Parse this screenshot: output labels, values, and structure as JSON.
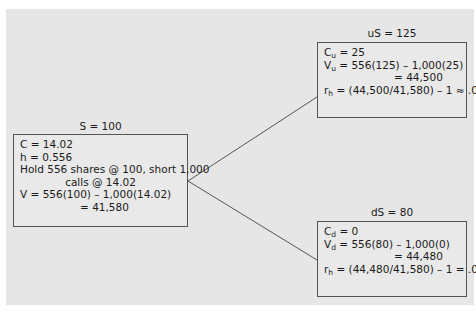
{
  "diagram": {
    "type": "binomial-tree",
    "root": {
      "label": "S = 100",
      "lines": [
        "C = 14.02",
        "h = 0.556",
        "Hold 556 shares @ 100, short 1,000",
        "calls @ 14.02",
        "V = 556(100) – 1,000(14.02)",
        "= 41,580"
      ]
    },
    "up": {
      "label": "uS = 125",
      "c_symbol": "C",
      "c_sub": "u",
      "c_value": " = 25",
      "v_symbol": "V",
      "v_sub": "u",
      "v_value": " = 556(125) – 1,000(25)",
      "v_result": "= 44,500",
      "r_symbol": "r",
      "r_sub": "h",
      "r_value": " = (44,500/41,580) – 1 ≈ .07"
    },
    "down": {
      "label": "dS = 80",
      "c_symbol": "C",
      "c_sub": "d",
      "c_value": " = 0",
      "v_symbol": "V",
      "v_sub": "d",
      "v_value": " = 556(80) – 1,000(0)",
      "v_result": "= 44,480",
      "r_symbol": "r",
      "r_sub": "h",
      "r_value": " = (44,480/41,580) – 1 = .07"
    },
    "colors": {
      "panel": "#e6e6e6",
      "border": "#555555",
      "text": "#1a1a1a"
    }
  }
}
